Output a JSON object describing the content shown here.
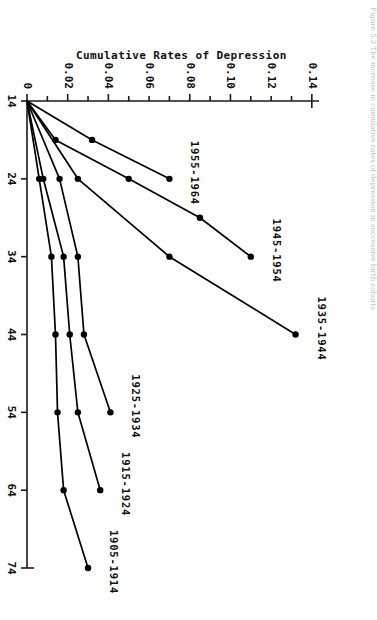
{
  "figure": {
    "caption": "Figure 5.2  The increase in cumulative rates of depression in successive birth cohorts",
    "orientation_note": "sideways"
  },
  "chart_data": {
    "type": "line",
    "title": "",
    "xlabel": "Age (Years)",
    "ylabel": "Cumulative Rates of Depression",
    "x_ticks": [
      "14",
      "24",
      "34",
      "44",
      "54",
      "64",
      "74"
    ],
    "x_tick_values": [
      14,
      24,
      34,
      44,
      54,
      64,
      74
    ],
    "xlim": [
      14,
      74
    ],
    "y_ticks": [
      "0",
      "0.02",
      "0.04",
      "0.06",
      "0.08",
      "0.10",
      "0.12",
      "0.14"
    ],
    "y_tick_values": [
      0,
      0.02,
      0.04,
      0.06,
      0.08,
      0.1,
      0.12,
      0.14
    ],
    "y_minor_step": 0.01,
    "ylim": [
      0,
      0.145
    ],
    "grid": false,
    "legend": "inline-end-labels",
    "marker": "filled-circle",
    "color": "#000000",
    "series": [
      {
        "name": "1955-1964",
        "label": "1955-1964",
        "x": [
          14,
          19,
          24
        ],
        "y": [
          0,
          0.032,
          0.07
        ]
      },
      {
        "name": "1945-1954",
        "label": "1945-1954",
        "x": [
          14,
          19,
          24,
          29,
          34
        ],
        "y": [
          0,
          0.014,
          0.05,
          0.085,
          0.11
        ]
      },
      {
        "name": "1935-1944",
        "label": "1935-1944",
        "x": [
          14,
          24,
          34,
          44
        ],
        "y": [
          0,
          0.025,
          0.07,
          0.132
        ]
      },
      {
        "name": "1925-1934",
        "label": "1925-1934",
        "x": [
          14,
          24,
          34,
          44,
          54
        ],
        "y": [
          0,
          0.016,
          0.025,
          0.028,
          0.041
        ]
      },
      {
        "name": "1915-1924",
        "label": "1915-1924",
        "x": [
          14,
          24,
          34,
          44,
          54,
          64
        ],
        "y": [
          0,
          0.008,
          0.018,
          0.021,
          0.025,
          0.036
        ]
      },
      {
        "name": "1905-1914",
        "label": "1905-1914",
        "x": [
          14,
          24,
          34,
          44,
          54,
          64,
          74
        ],
        "y": [
          0,
          0.006,
          0.012,
          0.014,
          0.015,
          0.018,
          0.03
        ]
      }
    ]
  }
}
